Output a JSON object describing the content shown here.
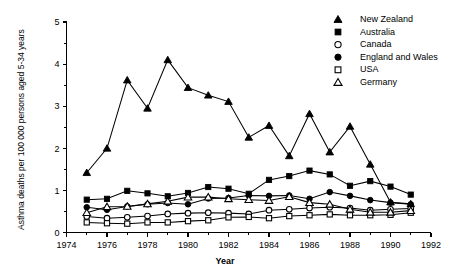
{
  "chart_data": {
    "type": "line",
    "title": "",
    "xlabel": "Year",
    "ylabel": "Asthma deaths per 100 000 persons aged 5-34 years",
    "xlim": [
      1974,
      1992
    ],
    "ylim": [
      0,
      5
    ],
    "xticks": [
      1974,
      1976,
      1978,
      1980,
      1982,
      1984,
      1986,
      1988,
      1990,
      1992
    ],
    "xticklabels": [
      "1974",
      "1976",
      "1978",
      "1980",
      "1982",
      "1984",
      "1986",
      "1988",
      "1990",
      "1992"
    ],
    "xminorticks": [
      1975,
      1977,
      1979,
      1981,
      1983,
      1985,
      1987,
      1989,
      1991
    ],
    "yticks": [
      0,
      1,
      2,
      3,
      4,
      5
    ],
    "yticklabels": [
      "0",
      "1",
      "2",
      "3",
      "4",
      "5"
    ],
    "yminorticks": [
      0.5,
      1.5,
      2.5,
      3.5,
      4.5
    ],
    "grid": false,
    "legend_position": "top-right",
    "x": [
      1975,
      1976,
      1977,
      1978,
      1979,
      1980,
      1981,
      1982,
      1983,
      1984,
      1985,
      1986,
      1987,
      1988,
      1989,
      1990,
      1991
    ],
    "series": [
      {
        "name": "New Zealand",
        "marker": "filled-triangle",
        "values": [
          1.42,
          2.0,
          3.62,
          2.95,
          4.1,
          3.44,
          3.26,
          3.11,
          2.26,
          2.54,
          1.82,
          2.82,
          1.91,
          2.52,
          1.62,
          0.72,
          0.68
        ]
      },
      {
        "name": "Australia",
        "marker": "filled-square",
        "values": [
          0.78,
          0.8,
          0.99,
          0.93,
          0.86,
          0.94,
          1.08,
          1.04,
          0.92,
          1.25,
          1.34,
          1.47,
          1.38,
          1.11,
          1.22,
          1.09,
          0.9
        ]
      },
      {
        "name": "Canada",
        "marker": "open-circle",
        "values": [
          0.38,
          0.34,
          0.36,
          0.39,
          0.44,
          0.46,
          0.47,
          0.46,
          0.44,
          0.53,
          0.55,
          0.58,
          0.6,
          0.58,
          0.53,
          0.55,
          0.57
        ]
      },
      {
        "name": "England and Wales",
        "marker": "filled-circle",
        "values": [
          0.6,
          0.54,
          0.62,
          0.67,
          0.7,
          0.67,
          0.81,
          0.82,
          0.88,
          0.87,
          0.88,
          0.8,
          0.96,
          0.87,
          0.77,
          0.71,
          0.67
        ]
      },
      {
        "name": "USA",
        "marker": "open-square",
        "values": [
          0.24,
          0.22,
          0.21,
          0.24,
          0.24,
          0.27,
          0.29,
          0.36,
          0.37,
          0.34,
          0.39,
          0.41,
          0.43,
          0.41,
          0.41,
          0.42,
          0.47
        ]
      },
      {
        "name": "Germany",
        "marker": "open-triangle",
        "values": [
          0.47,
          0.61,
          0.62,
          0.68,
          0.74,
          0.84,
          0.84,
          0.8,
          0.78,
          0.76,
          0.85,
          0.71,
          0.67,
          0.55,
          0.48,
          0.48,
          0.52
        ]
      }
    ]
  },
  "legend": {
    "items": [
      {
        "label": "New Zealand",
        "marker": "filled-triangle"
      },
      {
        "label": "Australia",
        "marker": "filled-square"
      },
      {
        "label": "Canada",
        "marker": "open-circle"
      },
      {
        "label": "England and Wales",
        "marker": "filled-circle"
      },
      {
        "label": "USA",
        "marker": "open-square"
      },
      {
        "label": "Germany",
        "marker": "open-triangle"
      }
    ]
  },
  "axes": {
    "x_title": "Year",
    "y_title": "Asthma deaths per 100 000 persons aged 5-34 years"
  }
}
